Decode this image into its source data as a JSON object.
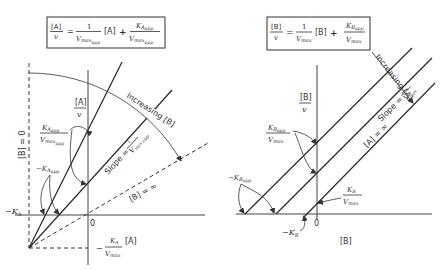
{
  "left_panel": {
    "equation": {
      "lhs_num": "[A]",
      "lhs_den": "v",
      "equals": "=",
      "coef_num": "1",
      "coef_den_main": "V",
      "coef_den_sub": "max",
      "coef_den_subsub": "app",
      "var": "[A]",
      "plus": "+",
      "k_main": "K",
      "k_sub": "A",
      "k_subsub": "app",
      "k_den_main": "V",
      "k_den_sub": "max",
      "k_den_subsub": "app"
    },
    "y_axis_label_num": "[A]",
    "y_axis_label_den": "v",
    "x_axis_label": "[A]",
    "origin_label": "0",
    "b_zero_label": "[B] = 0",
    "b_infinity_label": "[B] = ∞",
    "increasing_label": "Increasing [B]",
    "slope_label": "Slope =",
    "slope_num": "1",
    "slope_den": "V",
    "slope_den_sub": "max app",
    "intercept_label": {
      "num_main": "K",
      "num_sub": "A",
      "num_subsub": "app",
      "den_main": "V",
      "den_sub": "max",
      "den_subsub": "app"
    },
    "neg_k_app_label": {
      "main": "−K",
      "sub": "A",
      "subsub": "app"
    },
    "neg_ka_label": {
      "main": "−K",
      "sub": "A"
    },
    "ka_vmax_label": {
      "prefix": "−",
      "num_main": "K",
      "num_sub": "A",
      "den_main": "V",
      "den_sub": "max"
    }
  },
  "right_panel": {
    "equation": {
      "lhs_num": "[B]",
      "lhs_den": "v",
      "equals": "=",
      "coef_num": "1",
      "coef_den_main": "V",
      "coef_den_sub": "max",
      "var": "[B]",
      "plus": "+",
      "k_main": "K",
      "k_sub": "B",
      "k_subsub": "app",
      "k_den_main": "V",
      "k_den_sub": "max"
    },
    "y_axis_label_num": "[B]",
    "y_axis_label_den": "v",
    "x_axis_label": "[B]",
    "origin_label": "0",
    "a_infinity_label": "[A] = ∞",
    "increasing_label": "Increasing [A]",
    "slope_label": "Slope =",
    "slope_num": "1",
    "slope_den": "V",
    "slope_den_sub": "max",
    "intercept_label": {
      "num_main": "K",
      "num_sub": "B",
      "num_subsub": "app",
      "den_main": "V",
      "den_sub": "max"
    },
    "neg_k_app_label": {
      "main": "−K",
      "sub": "B",
      "subsub": "app"
    },
    "neg_kb_label": {
      "main": "−K",
      "sub": "B"
    },
    "kb_vmax_label": {
      "num_main": "K",
      "num_sub": "B",
      "den_main": "V",
      "den_sub": "max"
    }
  }
}
